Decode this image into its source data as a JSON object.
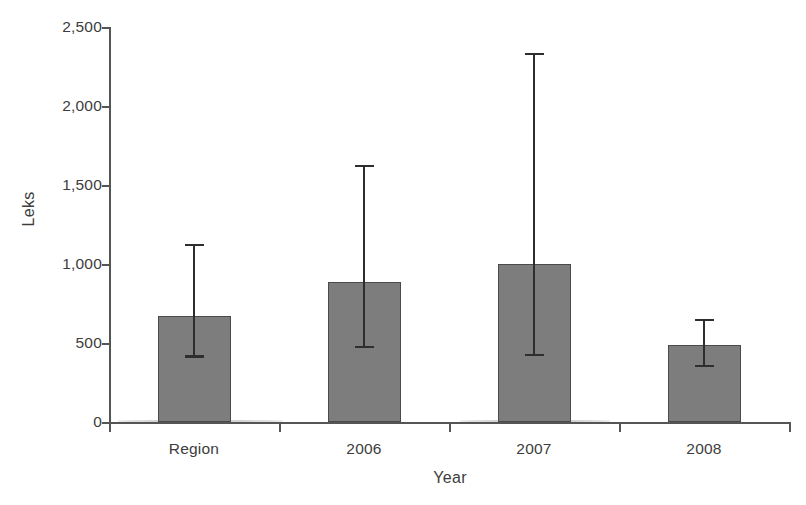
{
  "chart_data": {
    "type": "bar",
    "title": "",
    "xlabel": "Year",
    "ylabel": "Leks",
    "categories": [
      "Region",
      "2006",
      "2007",
      "2008"
    ],
    "values": [
      670,
      885,
      1000,
      490
    ],
    "error_low": [
      415,
      475,
      425,
      355
    ],
    "error_high": [
      1120,
      1620,
      2330,
      645
    ],
    "series": [
      {
        "name": "Leks",
        "values": [
          670,
          885,
          1000,
          490
        ],
        "error_low": [
          415,
          475,
          425,
          355
        ],
        "error_high": [
          1120,
          1620,
          2330,
          645
        ]
      }
    ],
    "ylim": [
      0,
      2500
    ],
    "yticks": [
      0,
      500,
      1000,
      1500,
      2000,
      2500
    ],
    "ytick_labels": [
      "0",
      "500",
      "1,000",
      "1,500",
      "2,000",
      "2,500"
    ],
    "grid": false,
    "legend": "none",
    "bar_color": "#7d7d7d",
    "bar_edge_color": "#4a4a4a",
    "error_bar_color": "#2e2e2e",
    "axis_color": "#555555"
  },
  "axis": {
    "y_title": "Leks",
    "x_title": "Year",
    "y_tick_labels": [
      "2,500",
      "2,000",
      "1,500",
      "1,000",
      "500",
      "0"
    ],
    "x_tick_labels": [
      "Region",
      "2006",
      "2007",
      "2008"
    ]
  }
}
